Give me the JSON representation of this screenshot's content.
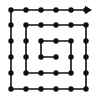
{
  "figure": {
    "background_color": "#ffffff",
    "ink_color": "#111111",
    "width": 100,
    "height": 100
  },
  "chart_data": {
    "type": "scatter",
    "subtitle": "",
    "xlabel": "",
    "ylabel": "",
    "grid": false,
    "legend": null,
    "xlim": [
      0,
      5
    ],
    "ylim": [
      0,
      5
    ],
    "tick_labels_x": [],
    "tick_labels_y": [],
    "annotations": [
      "arrowhead pointing right at top-right end of path"
    ],
    "grid_points": {
      "columns": 6,
      "rows": 6,
      "pixel_columns": [
        11,
        26,
        41,
        56,
        71,
        86
      ],
      "pixel_rows": [
        10,
        25,
        41,
        57,
        73,
        89
      ],
      "marker": "filled-circle",
      "marker_radius_px": 2.7,
      "marker_color": "#111111",
      "count": 36
    },
    "series": [
      {
        "name": "spiral-path",
        "stroke_color": "#111111",
        "stroke_width_px": 1.6,
        "arrow_end": "right",
        "vertices_grid": [
          [
            3,
            3
          ],
          [
            2,
            3
          ],
          [
            2,
            2
          ],
          [
            4,
            2
          ],
          [
            4,
            4
          ],
          [
            1,
            4
          ],
          [
            1,
            1
          ],
          [
            5,
            1
          ],
          [
            5,
            5
          ],
          [
            0,
            5
          ],
          [
            0,
            0
          ],
          [
            5,
            0
          ]
        ],
        "vertices_px": [
          [
            56,
            57
          ],
          [
            41,
            57
          ],
          [
            41,
            41
          ],
          [
            71,
            41
          ],
          [
            71,
            73
          ],
          [
            26,
            73
          ],
          [
            26,
            25
          ],
          [
            86,
            25
          ],
          [
            86,
            89
          ],
          [
            11,
            89
          ],
          [
            11,
            10
          ],
          [
            86,
            10
          ]
        ]
      }
    ]
  }
}
